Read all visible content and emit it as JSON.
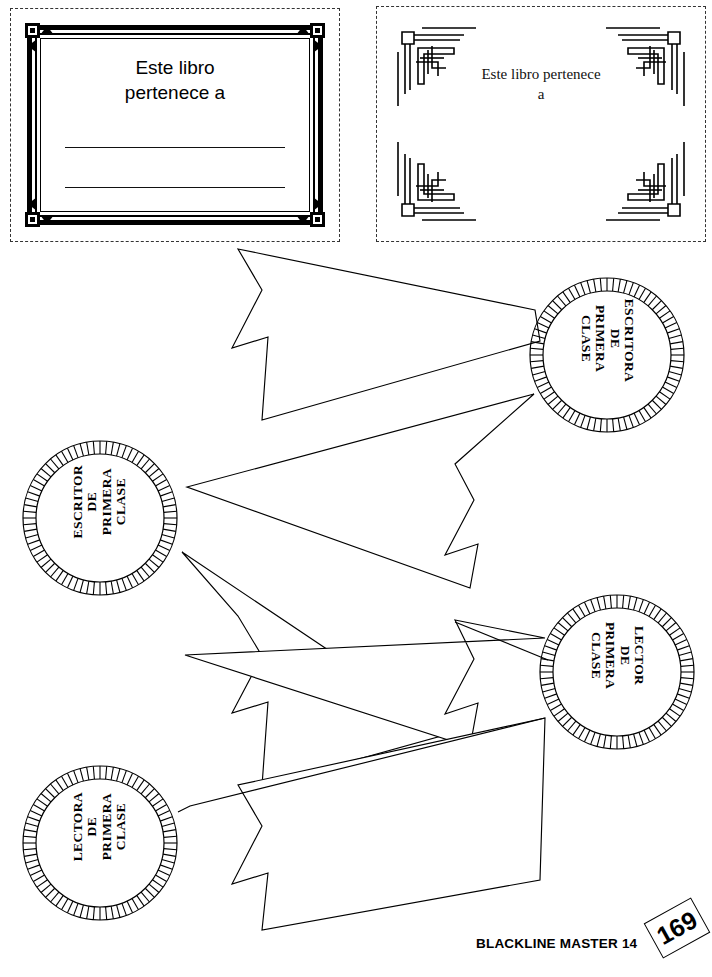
{
  "page": {
    "width": 712,
    "height": 977,
    "background": "#ffffff",
    "ink": "#000000"
  },
  "bookplates": [
    {
      "id": "ornate-frame-bookplate",
      "style": "ornate-deco-border",
      "title": "Este libro\npertenece a",
      "writing_lines": 2
    },
    {
      "id": "artdeco-corner-bookplate",
      "style": "art-deco-corner-ornaments",
      "title": "Este libro pertenece\na",
      "writing_lines": 0
    }
  ],
  "awards": [
    {
      "id": "escritora",
      "label": "ESCRITORA\nDE\nPRIMERA\nCLASE",
      "position": "right",
      "rotation": "cw"
    },
    {
      "id": "escritor",
      "label": "ESCRITOR\nDE\nPRIMERA\nCLASE",
      "position": "left",
      "rotation": "ccw"
    },
    {
      "id": "lector",
      "label": "LECTOR\nDE\nPRIMERA\nCLASE",
      "position": "right",
      "rotation": "cw"
    },
    {
      "id": "lectora",
      "label": "LECTORA\nDE\nPRIMERA\nCLASE",
      "position": "left",
      "rotation": "ccw"
    }
  ],
  "footer": {
    "master_label": "BLACKLINE MASTER 14",
    "page_number": "169"
  }
}
